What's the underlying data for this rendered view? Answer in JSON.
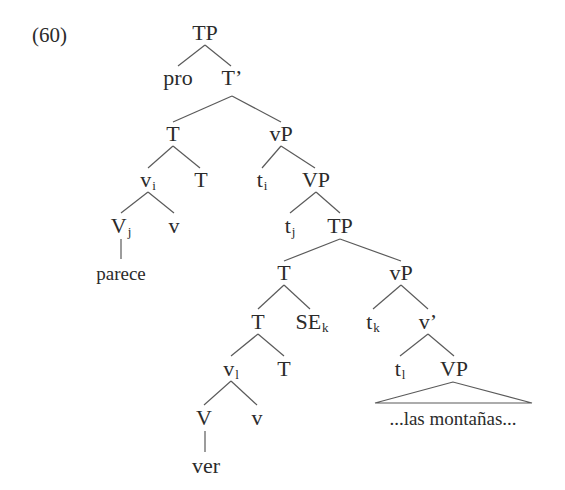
{
  "example_number": "(60)",
  "colors": {
    "text": "#2b2b2b",
    "lines": "#5a5a5a",
    "background": "#ffffff"
  },
  "tree": {
    "nodes": [
      {
        "id": "n1",
        "label": "TP",
        "sub": "",
        "x": 205,
        "y": 33
      },
      {
        "id": "n2",
        "label": "pro",
        "sub": "",
        "x": 178,
        "y": 78
      },
      {
        "id": "n3",
        "label": "T’",
        "sub": "",
        "x": 232,
        "y": 78
      },
      {
        "id": "n4",
        "label": "T",
        "sub": "",
        "x": 173,
        "y": 134
      },
      {
        "id": "n5",
        "label": "vP",
        "sub": "",
        "x": 281,
        "y": 134
      },
      {
        "id": "n6",
        "label": "v",
        "sub": "i",
        "x": 148,
        "y": 180
      },
      {
        "id": "n7",
        "label": "T",
        "sub": "",
        "x": 201,
        "y": 180
      },
      {
        "id": "n8",
        "label": "t",
        "sub": "i",
        "x": 262,
        "y": 180
      },
      {
        "id": "n9",
        "label": "VP",
        "sub": "",
        "x": 316,
        "y": 180
      },
      {
        "id": "n10",
        "label": "V",
        "sub": "j",
        "x": 121,
        "y": 226
      },
      {
        "id": "n11",
        "label": "v",
        "sub": "",
        "x": 174,
        "y": 226
      },
      {
        "id": "n12",
        "label": "parece",
        "sub": "",
        "x": 121,
        "y": 273
      },
      {
        "id": "n13",
        "label": "t",
        "sub": "j",
        "x": 290,
        "y": 226
      },
      {
        "id": "n14",
        "label": "TP",
        "sub": "",
        "x": 340,
        "y": 226
      },
      {
        "id": "n15",
        "label": "T",
        "sub": "",
        "x": 284,
        "y": 273
      },
      {
        "id": "n16",
        "label": "vP",
        "sub": "",
        "x": 401,
        "y": 273
      },
      {
        "id": "n17",
        "label": "T",
        "sub": "",
        "x": 258,
        "y": 322
      },
      {
        "id": "n18",
        "label": "SE",
        "sub": "k",
        "x": 312,
        "y": 322
      },
      {
        "id": "n19",
        "label": "t",
        "sub": "k",
        "x": 373,
        "y": 322
      },
      {
        "id": "n20",
        "label": "v’",
        "sub": "",
        "x": 428,
        "y": 322
      },
      {
        "id": "n21",
        "label": "v",
        "sub": "l",
        "x": 231,
        "y": 369
      },
      {
        "id": "n22",
        "label": "T",
        "sub": "",
        "x": 284,
        "y": 369
      },
      {
        "id": "n23",
        "label": "t",
        "sub": "l",
        "x": 400,
        "y": 369
      },
      {
        "id": "n24",
        "label": "VP",
        "sub": "",
        "x": 454,
        "y": 369
      },
      {
        "id": "n25",
        "label": "V",
        "sub": "",
        "x": 204,
        "y": 418
      },
      {
        "id": "n26",
        "label": "v",
        "sub": "",
        "x": 257,
        "y": 418
      },
      {
        "id": "n27",
        "label": "ver",
        "sub": "",
        "x": 206,
        "y": 466
      },
      {
        "id": "n28",
        "label": "...las montañas...",
        "sub": "",
        "x": 453,
        "y": 418
      }
    ],
    "edges": [
      [
        205,
        45,
        178,
        66
      ],
      [
        205,
        45,
        231,
        66
      ],
      [
        232,
        96,
        173,
        122
      ],
      [
        232,
        96,
        281,
        122
      ],
      [
        173,
        146,
        148,
        168
      ],
      [
        173,
        146,
        200,
        168
      ],
      [
        281,
        146,
        262,
        168
      ],
      [
        281,
        146,
        315,
        168
      ],
      [
        148,
        192,
        121,
        213
      ],
      [
        148,
        192,
        174,
        213
      ],
      [
        121,
        239,
        121,
        259
      ],
      [
        316,
        192,
        290,
        213
      ],
      [
        316,
        192,
        340,
        213
      ],
      [
        340,
        239,
        284,
        261
      ],
      [
        340,
        239,
        401,
        261
      ],
      [
        284,
        285,
        258,
        309
      ],
      [
        284,
        285,
        310,
        309
      ],
      [
        401,
        285,
        373,
        309
      ],
      [
        401,
        285,
        428,
        309
      ],
      [
        258,
        334,
        231,
        356
      ],
      [
        258,
        334,
        284,
        356
      ],
      [
        428,
        334,
        400,
        356
      ],
      [
        428,
        334,
        454,
        356
      ],
      [
        231,
        381,
        204,
        405
      ],
      [
        231,
        381,
        257,
        405
      ],
      [
        205,
        431,
        205,
        452
      ]
    ],
    "triangles": [
      {
        "apex": [
          453,
          382
        ],
        "left": [
          375,
          403
        ],
        "right": [
          532,
          403
        ]
      }
    ]
  }
}
